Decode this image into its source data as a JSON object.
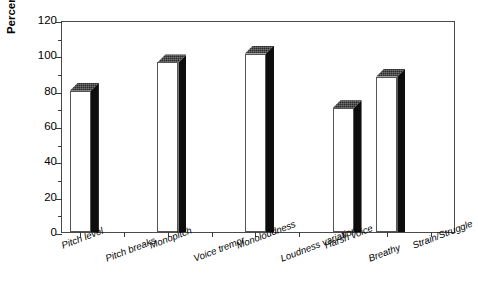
{
  "chart_data": {
    "type": "bar",
    "title": "",
    "xlabel": "",
    "ylabel": "Percent of Patients",
    "ylim": [
      0,
      120
    ],
    "ytick_values": [
      0,
      20,
      40,
      60,
      80,
      100,
      120
    ],
    "ytick_labels": [
      "0",
      "20",
      "40",
      "60",
      "80",
      "100",
      "120"
    ],
    "minor_tick_step": 10,
    "grid": false,
    "legend": "none",
    "style": "3d-block-bars",
    "categories": [
      "Pitch level",
      "Pitch breaks",
      "Monopitch",
      "Voice tremor",
      "Monoloudness",
      "Loudness variation",
      "Harsh voice",
      "Breathy",
      "Strain/Struggle"
    ],
    "values": [
      80,
      0,
      96,
      0,
      101,
      0,
      70,
      88,
      0
    ]
  },
  "axes": {
    "y_title": "Percent of Patients"
  }
}
